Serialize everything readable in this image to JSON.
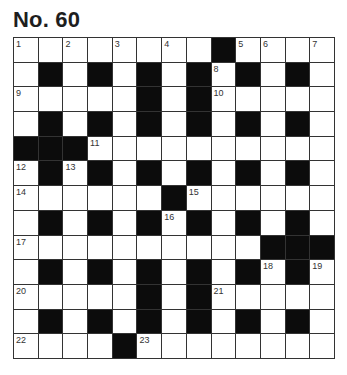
{
  "puzzle": {
    "title": "No. 60",
    "size": {
      "rows": 13,
      "cols": 13
    },
    "colors": {
      "block": "#0c0c0c",
      "cell": "#ffffff",
      "grid_line": "#333333",
      "text": "#1e1e1e"
    },
    "grid": [
      [
        "1",
        ".",
        "2",
        ".",
        "3",
        ".",
        "4",
        ".",
        "#",
        "5",
        "6",
        ".",
        "7"
      ],
      [
        ".",
        "#",
        ".",
        "#",
        ".",
        "#",
        ".",
        "#",
        "8",
        "#",
        ".",
        "#",
        "."
      ],
      [
        "9",
        ".",
        ".",
        ".",
        ".",
        "#",
        ".",
        "#",
        "10",
        ".",
        ".",
        ".",
        "."
      ],
      [
        ".",
        "#",
        ".",
        "#",
        ".",
        "#",
        ".",
        "#",
        ".",
        "#",
        ".",
        "#",
        "."
      ],
      [
        "#",
        "#",
        "#",
        "11",
        ".",
        ".",
        ".",
        ".",
        ".",
        ".",
        ".",
        ".",
        "."
      ],
      [
        "12",
        "#",
        "13",
        "#",
        ".",
        "#",
        ".",
        "#",
        ".",
        "#",
        ".",
        "#",
        "."
      ],
      [
        "14",
        ".",
        ".",
        ".",
        ".",
        ".",
        "#",
        "15",
        ".",
        ".",
        ".",
        ".",
        "."
      ],
      [
        ".",
        "#",
        ".",
        "#",
        ".",
        "#",
        "16",
        "#",
        ".",
        "#",
        ".",
        "#",
        "."
      ],
      [
        "17",
        ".",
        ".",
        ".",
        ".",
        ".",
        ".",
        ".",
        ".",
        ".",
        "#",
        "#",
        "#"
      ],
      [
        ".",
        "#",
        ".",
        "#",
        ".",
        "#",
        ".",
        "#",
        ".",
        "#",
        "18",
        "#",
        "19"
      ],
      [
        "20",
        ".",
        ".",
        ".",
        ".",
        "#",
        ".",
        "#",
        "21",
        ".",
        ".",
        ".",
        "."
      ],
      [
        ".",
        "#",
        ".",
        "#",
        ".",
        "#",
        ".",
        "#",
        ".",
        "#",
        ".",
        "#",
        "."
      ],
      [
        "22",
        ".",
        ".",
        ".",
        "#",
        "23",
        ".",
        ".",
        ".",
        ".",
        ".",
        ".",
        "."
      ]
    ],
    "clue_numbers": [
      "1",
      "2",
      "3",
      "4",
      "5",
      "6",
      "7",
      "8",
      "9",
      "10",
      "11",
      "12",
      "13",
      "14",
      "15",
      "16",
      "17",
      "18",
      "19",
      "20",
      "21",
      "22",
      "23"
    ]
  }
}
